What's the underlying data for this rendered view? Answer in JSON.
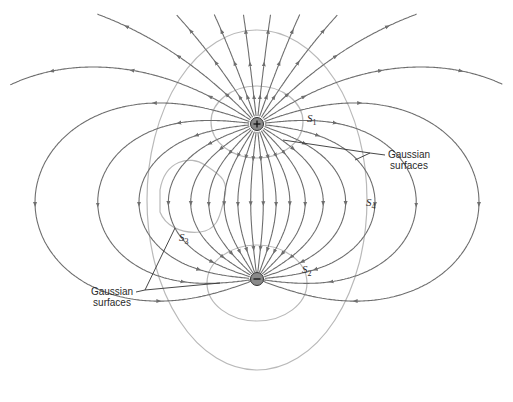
{
  "diagram": {
    "colors": {
      "field_line": "#6e6e6e",
      "gaussian_surface": "#b9b9b9",
      "charge_fill": "#8a8a8a",
      "leader": "#333333",
      "text": "#2a2a2a"
    },
    "charges": [
      {
        "id": "positive",
        "sign": "+",
        "symbol": "⊕"
      },
      {
        "id": "negative",
        "sign": "−",
        "symbol": "⊖"
      }
    ],
    "surfaces": [
      {
        "id": "S1",
        "letter": "S",
        "sub": "1",
        "encloses": "positive charge"
      },
      {
        "id": "S2",
        "letter": "S",
        "sub": "2",
        "encloses": "negative charge"
      },
      {
        "id": "S3",
        "letter": "S",
        "sub": "3",
        "encloses": "no charge"
      },
      {
        "id": "S4",
        "letter": "S",
        "sub": "4",
        "encloses": "both charges"
      }
    ],
    "callouts": [
      {
        "id": "callout-right",
        "line1": "Gaussian",
        "line2": "surfaces"
      },
      {
        "id": "callout-left",
        "line1": "Gaussian",
        "line2": "surfaces"
      }
    ]
  }
}
